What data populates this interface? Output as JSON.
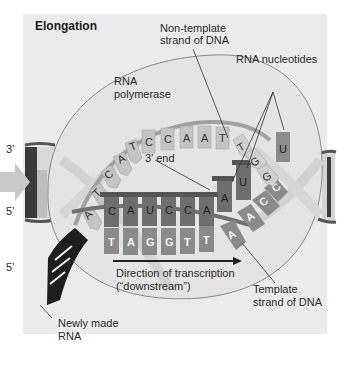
{
  "title": "Elongation",
  "labels": {
    "non_template_line1": "Non-template",
    "non_template_line2": "strand of DNA",
    "rna_nucleotides": "RNA nucleotides",
    "rna_polymerase_line1": "RNA",
    "rna_polymerase_line2": "polymerase",
    "three_prime_end": "3’ end",
    "direction_line1": "Direction of transcription",
    "direction_line2": "(“downstream”)",
    "template_line1": "Template",
    "template_line2": "strand of DNA",
    "newly_made_line1": "Newly made",
    "newly_made_line2": "RNA"
  },
  "strand_ends": {
    "left_top": "3’",
    "left_bottom": "5’",
    "rna_5prime": "5’"
  },
  "sequences": {
    "non_template_strand": [
      "A",
      "T",
      "C",
      "A",
      "T",
      "C",
      "C",
      "A",
      "A",
      "T",
      "T",
      "G",
      "G"
    ],
    "rna_transcript": [
      "C",
      "A",
      "U",
      "C",
      "C",
      "A",
      "A",
      "U"
    ],
    "template_strand": [
      "T",
      "A",
      "G",
      "G",
      "T",
      "T",
      "A",
      "A",
      "C",
      "C"
    ],
    "incoming_rna_nucleotides": [
      "A",
      "U",
      "U"
    ]
  },
  "colors": {
    "panel_bg": "#ebebeb",
    "polymerase_fill": "#e3e3e3",
    "non_template_base": "#c4c4c4",
    "rna_base": "#6e6e6e",
    "template_base": "#8a8a8a",
    "backbone": "#5a5a5a",
    "newly_made_rna": "#1e1e1e"
  }
}
